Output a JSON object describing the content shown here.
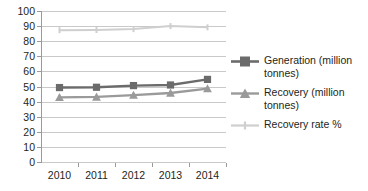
{
  "chart_data": {
    "type": "line",
    "title": "",
    "xlabel": "",
    "ylabel": "",
    "categories": [
      "2010",
      "2011",
      "2012",
      "2013",
      "2014"
    ],
    "ylim": [
      0,
      100
    ],
    "yticks": [
      "0",
      "10",
      "20",
      "30",
      "40",
      "50",
      "60",
      "70",
      "80",
      "90",
      "100"
    ],
    "grid": true,
    "legend_position": "right",
    "series": [
      {
        "name": "Generation (million tonnes)",
        "values": [
          49.3,
          49.5,
          50.6,
          51.0,
          54.7
        ],
        "color": "#6b6b6b",
        "marker": "square"
      },
      {
        "name": "Recovery (million tonnes)",
        "values": [
          42.8,
          43.1,
          44.3,
          45.7,
          48.6
        ],
        "color": "#9a9a9a",
        "marker": "triangle"
      },
      {
        "name": "Recovery rate %",
        "values": [
          87.3,
          87.4,
          88.0,
          90.0,
          89.2
        ],
        "color": "#cfcfcf",
        "marker": "line"
      }
    ]
  },
  "legend": {
    "items": [
      {
        "label": "Generation (million tonnes)"
      },
      {
        "label": "Recovery (million tonnes)"
      },
      {
        "label": "Recovery rate %"
      }
    ]
  },
  "axes": {
    "y": {
      "ticks": [
        "100",
        "90",
        "80",
        "70",
        "60",
        "50",
        "40",
        "30",
        "20",
        "10",
        "0"
      ]
    },
    "x": {
      "ticks": [
        "2010",
        "2011",
        "2012",
        "2013",
        "2014"
      ]
    }
  }
}
